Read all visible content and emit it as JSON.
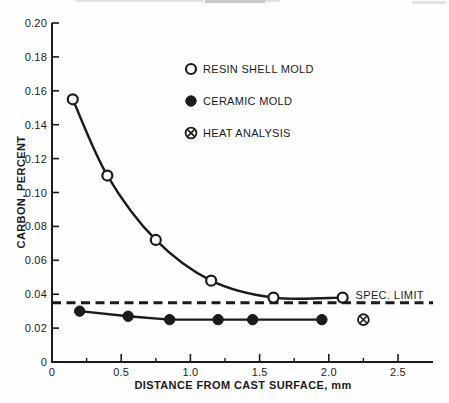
{
  "figure": {
    "ink_color": "#1b1b1b",
    "paper_color": "#fefefe"
  },
  "chart_data": {
    "type": "scatter",
    "title": "",
    "xlabel": "DISTANCE FROM CAST SURFACE, mm",
    "ylabel": "CARBON, PERCENT",
    "xlim": [
      0,
      2.75
    ],
    "ylim": [
      0,
      0.2
    ],
    "grid": false,
    "legend_position": "upper-center-inside",
    "x_major_ticks": [
      0,
      0.5,
      1.0,
      1.5,
      2.0,
      2.5
    ],
    "x_major_tick_labels": [
      "0",
      "0.5",
      "1.0",
      "1.5",
      "2.0",
      "2.5"
    ],
    "x_minor_ticks": [
      0.25,
      0.75,
      1.25,
      1.75,
      2.25
    ],
    "y_ticks": [
      0,
      0.02,
      0.04,
      0.06,
      0.08,
      0.1,
      0.12,
      0.14,
      0.16,
      0.18,
      0.2
    ],
    "y_tick_labels": [
      "0",
      "0.02",
      "0.04",
      "0.06",
      "0.08",
      "0.10",
      "0.12",
      "0.14",
      "0.16",
      "0.18",
      "0.20"
    ],
    "series": [
      {
        "name": "RESIN SHELL MOLD",
        "marker": "open-circle",
        "line": "smooth",
        "x": [
          0.15,
          0.4,
          0.75,
          1.15,
          1.6,
          2.1
        ],
        "y": [
          0.155,
          0.11,
          0.072,
          0.048,
          0.038,
          0.038
        ]
      },
      {
        "name": "CERAMIC MOLD",
        "marker": "filled-circle",
        "line": "straight",
        "x": [
          0.2,
          0.55,
          0.85,
          1.2,
          1.45,
          1.95
        ],
        "y": [
          0.03,
          0.027,
          0.025,
          0.025,
          0.025,
          0.025
        ]
      },
      {
        "name": "HEAT ANALYSIS",
        "marker": "circle-x",
        "line": "none",
        "x": [
          2.25
        ],
        "y": [
          0.025
        ]
      }
    ],
    "reference_lines": [
      {
        "label": "SPEC. LIMIT",
        "y": 0.035,
        "style": "dashed"
      }
    ],
    "annotations": [
      {
        "text": "SPEC. LIMIT",
        "x": 2.68,
        "y": 0.0385,
        "anchor": "end"
      }
    ]
  }
}
